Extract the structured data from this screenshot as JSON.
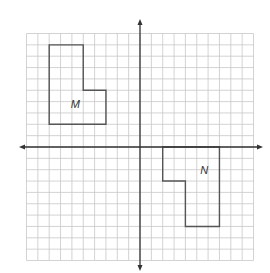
{
  "figure": {
    "grid": {
      "x_min": -10,
      "x_max": 10,
      "y_min": -10,
      "y_max": 10,
      "origin_px": [
        140,
        147
      ],
      "cell_px": 11.35,
      "grid_color": "#c8c8c8",
      "axis_color": "#333333"
    },
    "axes": {
      "x_arrow_ends_px": [
        19,
        263
      ],
      "y_arrow_ends_px": [
        19,
        271
      ]
    },
    "shapes": [
      {
        "name": "M",
        "label": "M",
        "vertices": [
          [
            -8,
            9
          ],
          [
            -5,
            9
          ],
          [
            -5,
            5
          ],
          [
            -3,
            5
          ],
          [
            -3,
            2
          ],
          [
            -8,
            2
          ]
        ],
        "label_pos": [
          -6.1,
          3.4
        ],
        "stroke": "#555555"
      },
      {
        "name": "N",
        "label": "N",
        "vertices": [
          [
            2,
            0
          ],
          [
            7,
            0
          ],
          [
            7,
            -7
          ],
          [
            4,
            -7
          ],
          [
            4,
            -3
          ],
          [
            2,
            -3
          ]
        ],
        "label_pos": [
          5.3,
          -2.4
        ],
        "stroke": "#555555"
      }
    ]
  }
}
